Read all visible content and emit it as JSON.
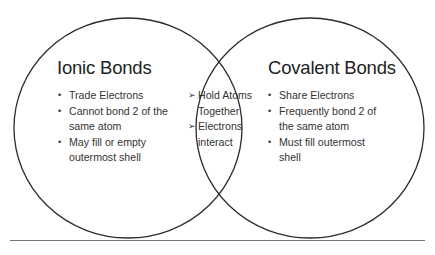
{
  "diagram": {
    "type": "venn",
    "left_set": {
      "title": "Ionic Bonds",
      "items": [
        "Trade Electrons",
        "Cannot bond 2 of the same atom",
        "May fill or empty outermost shell"
      ]
    },
    "overlap": {
      "marker": "➢",
      "items": [
        "Hold Atoms Together",
        "Electrons interact"
      ]
    },
    "right_set": {
      "title": "Covalent Bonds",
      "items": [
        "Share Electrons",
        "Frequently bond 2 of the same atom",
        "Must fill outermost shell"
      ]
    },
    "colors": {
      "stroke": "#2b2b2b",
      "text": "#333333",
      "rule": "#777777"
    }
  }
}
